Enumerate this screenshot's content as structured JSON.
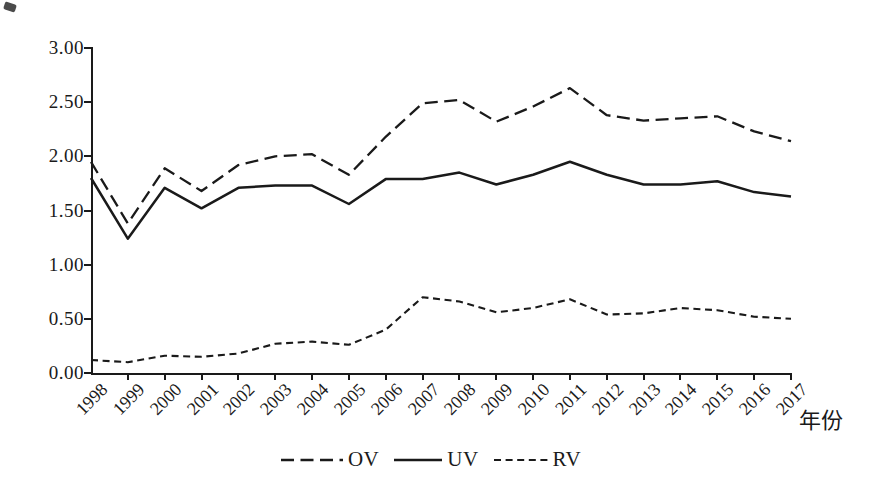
{
  "chart_data": {
    "type": "line",
    "title": "",
    "x": [
      "1998",
      "1999",
      "2000",
      "2001",
      "2002",
      "2003",
      "2004",
      "2005",
      "2006",
      "2007",
      "2008",
      "2009",
      "2010",
      "2011",
      "2012",
      "2013",
      "2014",
      "2015",
      "2016",
      "2017"
    ],
    "series": [
      {
        "name": "OV",
        "line_style": "long-dash",
        "values": [
          1.95,
          1.38,
          1.89,
          1.68,
          1.92,
          2.0,
          2.02,
          1.83,
          2.18,
          2.49,
          2.52,
          2.32,
          2.46,
          2.63,
          2.38,
          2.33,
          2.35,
          2.37,
          2.23,
          2.14
        ]
      },
      {
        "name": "UV",
        "line_style": "solid",
        "values": [
          1.8,
          1.24,
          1.71,
          1.52,
          1.71,
          1.73,
          1.73,
          1.56,
          1.79,
          1.79,
          1.85,
          1.74,
          1.83,
          1.95,
          1.83,
          1.74,
          1.74,
          1.77,
          1.67,
          1.63
        ]
      },
      {
        "name": "RV",
        "line_style": "short-dash",
        "values": [
          0.12,
          0.1,
          0.16,
          0.15,
          0.18,
          0.27,
          0.29,
          0.26,
          0.4,
          0.7,
          0.66,
          0.56,
          0.6,
          0.68,
          0.54,
          0.55,
          0.6,
          0.58,
          0.52,
          0.5
        ]
      }
    ],
    "xlabel": "年份",
    "ylim": [
      0,
      3
    ],
    "ytick_labels": [
      "0.00",
      "0.50",
      "1.00",
      "1.50",
      "2.00",
      "2.50",
      "3.00"
    ],
    "ytick_step": 0.5,
    "grid": false,
    "legend_position": "bottom-center",
    "line_color": "#1a1a1a",
    "background": "#ffffff"
  }
}
